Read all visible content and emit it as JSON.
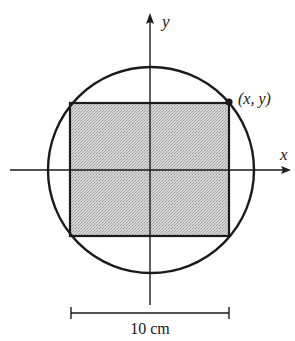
{
  "figure": {
    "axes": {
      "x_label": "x",
      "y_label": "y"
    },
    "point_label": "(x, y)",
    "dimension_label": "10 cm",
    "shapes": {
      "circle": "circle centered at origin",
      "rectangle": "shaded rectangle inscribed in circle with corner at (x, y)"
    },
    "colors": {
      "stroke": "#1a1a1a",
      "fill": "#c8c8c8",
      "background": "#ffffff"
    }
  }
}
